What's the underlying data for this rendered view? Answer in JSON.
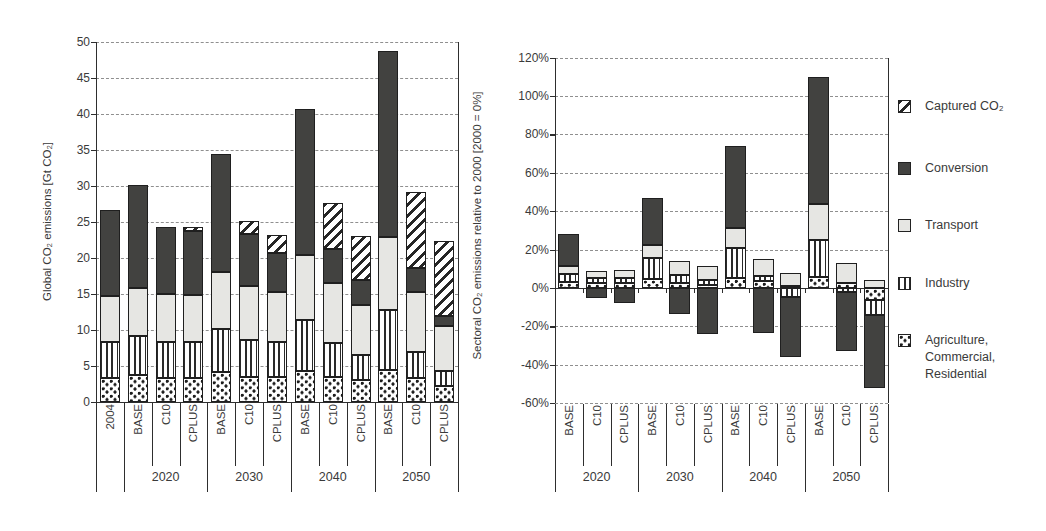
{
  "figure": {
    "left_axis_title": "Global CO₂ emissions [Gt CO₂]",
    "right_axis_title": "Sectoral CO₂ emissions relative to 2000 [2000 = 0%]"
  },
  "legend": {
    "position": "right",
    "items": [
      {
        "key": "captured",
        "label": "Captured CO₂",
        "lines": [
          "Captured CO₂"
        ]
      },
      {
        "key": "conversion",
        "label": "Conversion",
        "lines": [
          "Conversion"
        ]
      },
      {
        "key": "transport",
        "label": "Transport",
        "lines": [
          "Transport"
        ]
      },
      {
        "key": "industry",
        "label": "Industry",
        "lines": [
          "Industry"
        ]
      },
      {
        "key": "agriculture",
        "label": "Agriculture, Commercial, Residential",
        "lines": [
          "Agriculture,",
          "Commercial,",
          "Residential"
        ]
      }
    ]
  },
  "chart_data": [
    {
      "type": "bar",
      "variant": "stacked-vertical",
      "title": "",
      "ylabel": "Global CO₂ emissions [Gt CO₂]",
      "xlabel": "",
      "ylim": [
        0,
        50
      ],
      "grid": "dashed-horizontal",
      "series_keys": [
        "agriculture",
        "industry",
        "transport",
        "conversion",
        "captured"
      ],
      "series_names": [
        "Agriculture, Commercial, Residential",
        "Industry",
        "Transport",
        "Conversion",
        "Captured CO₂"
      ],
      "yticks": [
        {
          "v": 0,
          "label": "0"
        },
        {
          "v": 5,
          "label": "5"
        },
        {
          "v": 10,
          "label": "10"
        },
        {
          "v": 15,
          "label": "15"
        },
        {
          "v": 20,
          "label": "20"
        },
        {
          "v": 25,
          "label": "25"
        },
        {
          "v": 30,
          "label": "30"
        },
        {
          "v": 35,
          "label": "35"
        },
        {
          "v": 40,
          "label": "40"
        },
        {
          "v": 45,
          "label": "45"
        },
        {
          "v": 50,
          "label": "50"
        }
      ],
      "groups": [
        {
          "label": "2020",
          "start": 1,
          "count": 3
        },
        {
          "label": "2030",
          "start": 4,
          "count": 3
        },
        {
          "label": "2040",
          "start": 7,
          "count": 3
        },
        {
          "label": "2050",
          "start": 10,
          "count": 3
        }
      ],
      "bars": [
        {
          "label": "2004",
          "group": "",
          "values": {
            "agriculture": 3.4,
            "industry": 5.0,
            "transport": 6.3,
            "conversion": 11.9,
            "captured": 0
          }
        },
        {
          "label": "BASE",
          "group": "2020",
          "values": {
            "agriculture": 3.8,
            "industry": 5.4,
            "transport": 6.6,
            "conversion": 14.4,
            "captured": 0
          }
        },
        {
          "label": "C10",
          "group": "2020",
          "values": {
            "agriculture": 3.3,
            "industry": 5.0,
            "transport": 6.7,
            "conversion": 9.3,
            "captured": 0
          }
        },
        {
          "label": "CPLUS",
          "group": "2020",
          "values": {
            "agriculture": 3.4,
            "industry": 5.0,
            "transport": 6.5,
            "conversion": 8.8,
            "captured": 0.6
          }
        },
        {
          "label": "BASE",
          "group": "2030",
          "values": {
            "agriculture": 4.1,
            "industry": 6.1,
            "transport": 7.8,
            "conversion": 16.5,
            "captured": 0
          }
        },
        {
          "label": "C10",
          "group": "2030",
          "values": {
            "agriculture": 3.5,
            "industry": 5.1,
            "transport": 7.5,
            "conversion": 7.3,
            "captured": 1.7
          }
        },
        {
          "label": "CPLUS",
          "group": "2030",
          "values": {
            "agriculture": 3.5,
            "industry": 4.8,
            "transport": 7.0,
            "conversion": 5.4,
            "captured": 2.5
          }
        },
        {
          "label": "BASE",
          "group": "2040",
          "values": {
            "agriculture": 4.3,
            "industry": 7.1,
            "transport": 9.0,
            "conversion": 20.3,
            "captured": 0
          }
        },
        {
          "label": "C10",
          "group": "2040",
          "values": {
            "agriculture": 3.5,
            "industry": 4.7,
            "transport": 8.3,
            "conversion": 4.8,
            "captured": 6.4
          }
        },
        {
          "label": "CPLUS",
          "group": "2040",
          "values": {
            "agriculture": 3.1,
            "industry": 3.4,
            "transport": 7.0,
            "conversion": 3.4,
            "captured": 6.2
          }
        },
        {
          "label": "BASE",
          "group": "2050",
          "values": {
            "agriculture": 4.5,
            "industry": 8.3,
            "transport": 10.1,
            "conversion": 25.8,
            "captured": 0
          }
        },
        {
          "label": "C10",
          "group": "2050",
          "values": {
            "agriculture": 3.3,
            "industry": 3.7,
            "transport": 8.3,
            "conversion": 3.3,
            "captured": 10.6
          }
        },
        {
          "label": "CPLUS",
          "group": "2050",
          "values": {
            "agriculture": 2.2,
            "industry": 2.1,
            "transport": 6.2,
            "conversion": 1.5,
            "captured": 10.3
          }
        }
      ]
    },
    {
      "type": "bar",
      "variant": "stacked-vertical-diverging",
      "title": "",
      "ylabel": "Sectoral CO₂ emissions relative to 2000 [2000 = 0%]",
      "xlabel": "",
      "ylim": [
        -60,
        120
      ],
      "grid": "dashed-horizontal",
      "series_keys": [
        "agriculture",
        "industry",
        "transport",
        "conversion",
        "captured"
      ],
      "series_names": [
        "Agriculture, Commercial, Residential",
        "Industry",
        "Transport",
        "Conversion",
        "Captured CO₂"
      ],
      "yticks": [
        {
          "v": 120,
          "label": "120%"
        },
        {
          "v": 100,
          "label": "100%"
        },
        {
          "v": 80,
          "label": "80%"
        },
        {
          "v": 60,
          "label": "60%"
        },
        {
          "v": 40,
          "label": "40%"
        },
        {
          "v": 20,
          "label": "20%"
        },
        {
          "v": 0,
          "label": "0%"
        },
        {
          "v": -20,
          "label": "-20%"
        },
        {
          "v": -40,
          "label": "-40%"
        },
        {
          "v": -60,
          "label": "-60%"
        }
      ],
      "groups": [
        {
          "label": "2020",
          "start": 0,
          "count": 3
        },
        {
          "label": "2030",
          "start": 3,
          "count": 3
        },
        {
          "label": "2040",
          "start": 6,
          "count": 3
        },
        {
          "label": "2050",
          "start": 9,
          "count": 3
        }
      ],
      "bars": [
        {
          "label": "BASE",
          "group": "2020",
          "values": {
            "agriculture": 3.0,
            "industry": 4.5,
            "transport": 4.0,
            "conversion": 16.5,
            "captured": 0
          }
        },
        {
          "label": "C10",
          "group": "2020",
          "values": {
            "agriculture": 2.8,
            "industry": 2.6,
            "transport": 3.3,
            "conversion": -5.0,
            "captured": 0
          }
        },
        {
          "label": "CPLUS",
          "group": "2020",
          "values": {
            "agriculture": 2.6,
            "industry": 2.8,
            "transport": 3.8,
            "conversion": -7.8,
            "captured": 0
          }
        },
        {
          "label": "BASE",
          "group": "2030",
          "values": {
            "agriculture": 4.5,
            "industry": 11.0,
            "transport": 7.0,
            "conversion": 24.5,
            "captured": 0
          }
        },
        {
          "label": "C10",
          "group": "2030",
          "values": {
            "agriculture": 2.6,
            "industry": 4.0,
            "transport": 7.6,
            "conversion": -13.7,
            "captured": 0
          }
        },
        {
          "label": "CPLUS",
          "group": "2030",
          "values": {
            "agriculture": 1.4,
            "industry": 2.6,
            "transport": 7.5,
            "conversion": -24.0,
            "captured": 0
          }
        },
        {
          "label": "BASE",
          "group": "2040",
          "values": {
            "agriculture": 5.0,
            "industry": 16.0,
            "transport": 10.5,
            "conversion": 42.5,
            "captured": 0
          }
        },
        {
          "label": "C10",
          "group": "2040",
          "values": {
            "agriculture": 3.5,
            "industry": 2.5,
            "transport": 9.1,
            "conversion": -23.5,
            "captured": 0
          }
        },
        {
          "label": "CPLUS",
          "group": "2040",
          "values": {
            "agriculture": 1.0,
            "industry": -4.5,
            "transport": 6.6,
            "conversion": -31.5,
            "captured": 0
          }
        },
        {
          "label": "BASE",
          "group": "2050",
          "values": {
            "agriculture": 5.9,
            "industry": 19.1,
            "transport": 18.5,
            "conversion": 66.5,
            "captured": 0
          }
        },
        {
          "label": "C10",
          "group": "2050",
          "values": {
            "agriculture": 2.4,
            "industry": -2.0,
            "transport": 10.4,
            "conversion": -31.0,
            "captured": 0
          }
        },
        {
          "label": "CPLUS",
          "group": "2050",
          "values": {
            "agriculture": -6.2,
            "industry": -7.8,
            "transport": 4.2,
            "conversion": -38.0,
            "captured": 0
          }
        }
      ]
    }
  ]
}
